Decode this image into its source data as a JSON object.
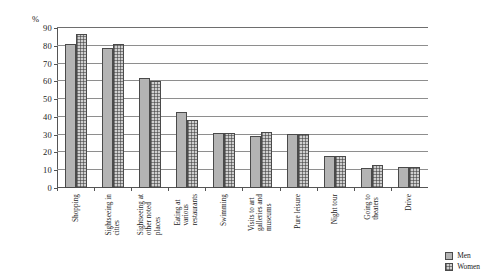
{
  "chart_data": {
    "type": "bar",
    "title": "",
    "subtitle": "",
    "xlabel": "",
    "ylabel": "%",
    "ylim": [
      0,
      90
    ],
    "ytick_step": 10,
    "yticks": [
      0,
      10,
      20,
      30,
      40,
      50,
      60,
      70,
      80,
      90
    ],
    "grid": true,
    "legend_position": "bottom-right",
    "categories": [
      "Shopping",
      "Sightseeing in cities",
      "Sightseeing at other noted places",
      "Eating at various restaurants",
      "Swimming",
      "Visits to art galleries and museums",
      "Pure leisure",
      "Night tour",
      "Going to theaters",
      "Drive"
    ],
    "category_lines": [
      [
        "Shopping"
      ],
      [
        "Sightseeing in",
        "cities"
      ],
      [
        "Sightseeing at",
        "other noted",
        "places"
      ],
      [
        "Eating at",
        "various",
        "restaurants"
      ],
      [
        "Swimming"
      ],
      [
        "Visits to art",
        "galleries and",
        "museums"
      ],
      [
        "Pure leisure"
      ],
      [
        "Night tour"
      ],
      [
        "Going to",
        "theaters"
      ],
      [
        "Drive"
      ]
    ],
    "series": [
      {
        "name": "Men",
        "color": "#b4b4b4",
        "values": [
          81,
          78.5,
          62,
          42.5,
          31,
          29.5,
          30.5,
          18,
          11.5,
          12
        ]
      },
      {
        "name": "Women",
        "color": "#cfcfcf",
        "values": [
          86.5,
          81,
          60,
          38,
          31,
          31.5,
          30.5,
          18,
          13,
          12
        ]
      }
    ]
  },
  "legend": {
    "items": [
      {
        "label": "Men"
      },
      {
        "label": "Women"
      }
    ]
  }
}
